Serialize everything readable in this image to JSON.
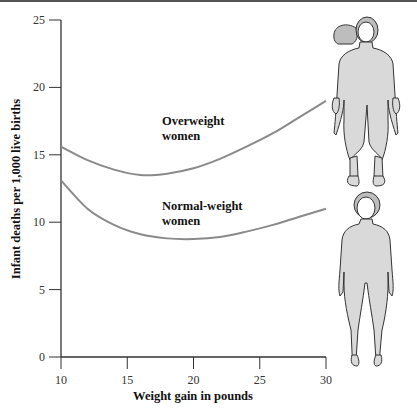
{
  "chart_data": {
    "type": "line",
    "title": "",
    "xlabel": "Weight gain in pounds",
    "ylabel": "Infant deaths per 1,000 live births",
    "xlim": [
      10,
      30
    ],
    "ylim": [
      0,
      25
    ],
    "x_ticks": [
      "10",
      "15",
      "20",
      "25",
      "30"
    ],
    "y_ticks": [
      "0",
      "5",
      "10",
      "15",
      "20",
      "25"
    ],
    "grid": false,
    "legend": "inline labels",
    "x": [
      10,
      12,
      14,
      16,
      18,
      20,
      22,
      24,
      26,
      28,
      30
    ],
    "series": [
      {
        "name": "Overweight women",
        "label_line1": "Overweight",
        "label_line2": "women",
        "color": "#8a8a8a",
        "values": [
          15.6,
          14.6,
          13.9,
          13.5,
          13.6,
          14.0,
          14.7,
          15.6,
          16.6,
          17.8,
          19.0
        ]
      },
      {
        "name": "Normal-weight women",
        "label_line1": "Normal-weight",
        "label_line2": "women",
        "color": "#8a8a8a",
        "values": [
          13.1,
          11.0,
          9.8,
          9.1,
          8.8,
          8.75,
          8.9,
          9.3,
          9.8,
          10.4,
          11.0
        ]
      }
    ],
    "illustrations": [
      {
        "name": "overweight-woman-figure",
        "fill": "#d9d9d9"
      },
      {
        "name": "normal-weight-woman-figure",
        "fill": "#d9d9d9"
      }
    ]
  }
}
